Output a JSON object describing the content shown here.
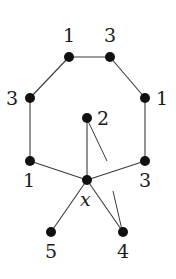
{
  "diagram": {
    "type": "graph",
    "center_vertex": {
      "label": "x"
    },
    "nodes": [
      {
        "id": "tl",
        "label": "1",
        "x": 69,
        "y": 57,
        "lx": 63,
        "ly": 42
      },
      {
        "id": "tr",
        "label": "3",
        "x": 110,
        "y": 57,
        "lx": 104,
        "ly": 42
      },
      {
        "id": "ml",
        "label": "3",
        "x": 30,
        "y": 98,
        "lx": 6,
        "ly": 105
      },
      {
        "id": "mr",
        "label": "1",
        "x": 145,
        "y": 98,
        "lx": 156,
        "ly": 105
      },
      {
        "id": "c2",
        "label": "2",
        "x": 87,
        "y": 118,
        "lx": 97,
        "ly": 125
      },
      {
        "id": "bl",
        "label": "1",
        "x": 30,
        "y": 161,
        "lx": 23,
        "ly": 187
      },
      {
        "id": "br",
        "label": "3",
        "x": 145,
        "y": 161,
        "lx": 139,
        "ly": 187
      },
      {
        "id": "x",
        "label": "x",
        "x": 87,
        "y": 180,
        "lx": 80,
        "ly": 206
      },
      {
        "id": "n5",
        "label": "5",
        "x": 51,
        "y": 232,
        "lx": 45,
        "ly": 258
      },
      {
        "id": "n4",
        "label": "4",
        "x": 123,
        "y": 232,
        "lx": 117,
        "ly": 258
      }
    ],
    "edges": [
      [
        "tl",
        "tr"
      ],
      [
        "tl",
        "ml"
      ],
      [
        "tr",
        "mr"
      ],
      [
        "ml",
        "bl"
      ],
      [
        "mr",
        "br"
      ],
      [
        "bl",
        "x"
      ],
      [
        "br",
        "x"
      ],
      [
        "c2",
        "x"
      ],
      [
        "x",
        "n5"
      ],
      [
        "x",
        "n4"
      ]
    ],
    "stubs": [
      {
        "x1": 88,
        "y1": 121,
        "x2": 107,
        "y2": 161
      },
      {
        "x1": 113,
        "y1": 191,
        "x2": 122,
        "y2": 230
      }
    ]
  }
}
